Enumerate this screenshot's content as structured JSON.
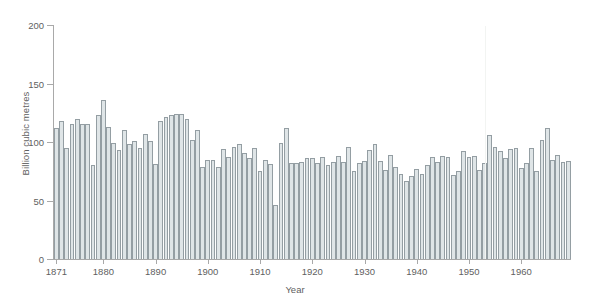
{
  "chart_data": {
    "type": "bar",
    "title": "",
    "subtitle": "",
    "xlabel": "Year",
    "ylabel": "Billion cubic metres",
    "xlim": [
      1870.5,
      1969.5
    ],
    "ylim": [
      0,
      200
    ],
    "grid": false,
    "legend": null,
    "y_ticks": [
      0,
      50,
      100,
      150,
      200
    ],
    "y_tick_labels": [
      "0",
      "50",
      "100",
      "150",
      "200"
    ],
    "x_ticks": [
      1871,
      1880,
      1890,
      1900,
      1910,
      1920,
      1930,
      1940,
      1950,
      1960
    ],
    "x_tick_labels": [
      "1871",
      "1880",
      "1890",
      "1900",
      "1910",
      "1920",
      "1930",
      "1940",
      "1950",
      "1960"
    ],
    "categories": [
      1871,
      1872,
      1873,
      1874,
      1875,
      1876,
      1877,
      1878,
      1879,
      1880,
      1881,
      1882,
      1883,
      1884,
      1885,
      1886,
      1887,
      1888,
      1889,
      1890,
      1891,
      1892,
      1893,
      1894,
      1895,
      1896,
      1897,
      1898,
      1899,
      1900,
      1901,
      1902,
      1903,
      1904,
      1905,
      1906,
      1907,
      1908,
      1909,
      1910,
      1911,
      1912,
      1913,
      1914,
      1915,
      1916,
      1917,
      1918,
      1919,
      1920,
      1921,
      1922,
      1923,
      1924,
      1925,
      1926,
      1927,
      1928,
      1929,
      1930,
      1931,
      1932,
      1933,
      1934,
      1935,
      1936,
      1937,
      1938,
      1939,
      1940,
      1941,
      1942,
      1943,
      1944,
      1945,
      1946,
      1947,
      1948,
      1949,
      1950,
      1951,
      1952,
      1953,
      1954,
      1955,
      1956,
      1957,
      1958,
      1959,
      1960,
      1961,
      1962,
      1963,
      1964,
      1965,
      1966,
      1967,
      1968,
      1969
    ],
    "values": [
      112,
      118,
      95,
      115,
      120,
      115,
      115,
      80,
      123,
      136,
      113,
      99,
      93,
      110,
      98,
      101,
      95,
      107,
      101,
      81,
      118,
      121,
      123,
      124,
      124,
      120,
      102,
      110,
      79,
      85,
      85,
      79,
      94,
      87,
      96,
      98,
      91,
      86,
      95,
      75,
      85,
      81,
      46,
      99,
      112,
      82,
      82,
      83,
      86,
      86,
      82,
      87,
      80,
      83,
      88,
      83,
      96,
      75,
      82,
      84,
      93,
      98,
      84,
      76,
      89,
      79,
      73,
      67,
      71,
      77,
      73,
      80,
      87,
      83,
      88,
      87,
      72,
      75,
      92,
      87,
      88,
      76,
      82,
      106,
      96,
      92,
      86,
      94,
      95,
      78,
      82,
      95,
      75,
      102,
      112,
      85,
      89,
      83,
      84
    ]
  },
  "figure": {
    "background_color": "#ffffff",
    "bar_fill_color": "#dfe5e7",
    "bar_border_color": "#949ea3",
    "axis_color": "#a9a9a9",
    "text_color": "#5f5f5f"
  }
}
